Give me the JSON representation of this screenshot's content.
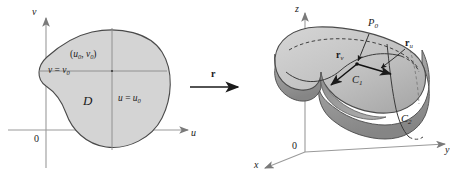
{
  "figure": {
    "background_color": "#ffffff",
    "ink_color": "#1a1a1a",
    "domain_fill": "#d4d4d4",
    "surface_fill_light": "#c9c9c9",
    "surface_fill_mid": "#b0b0b0",
    "surface_fill_dark": "#8f8f8f",
    "axis_color": "#9a9a9a"
  },
  "left_panel": {
    "name": "uv-parameter-plane",
    "axes": {
      "vertical_label": "v",
      "horizontal_label": "u",
      "origin_label": "0"
    },
    "region_label": "D",
    "point_label": {
      "open": "(",
      "u": "u",
      "u_sub": "0",
      "comma": ", ",
      "v": "v",
      "v_sub": "0",
      "close": ")"
    },
    "grid_line_v": {
      "var": "v",
      "op": " = ",
      "value": "v",
      "value_sub": "0"
    },
    "grid_line_u": {
      "var": "u",
      "op": " = ",
      "value": "u",
      "value_sub": "0"
    }
  },
  "map_arrow": {
    "name": "mapping-arrow",
    "label": "r"
  },
  "right_panel": {
    "name": "xyz-surface-space",
    "axes": {
      "z_label": "z",
      "y_label": "y",
      "x_label": "x",
      "origin_label": "0"
    },
    "point_label": {
      "text": "P",
      "sub": "0"
    },
    "tangent_vectors": [
      {
        "name": "r-sub-u",
        "text": "r",
        "sub": "u"
      },
      {
        "name": "r-sub-v",
        "text": "r",
        "sub": "v"
      }
    ],
    "grid_curves": [
      {
        "name": "curve-c1",
        "text": "C",
        "sub": "1"
      },
      {
        "name": "curve-c2",
        "text": "C",
        "sub": "2"
      }
    ]
  }
}
